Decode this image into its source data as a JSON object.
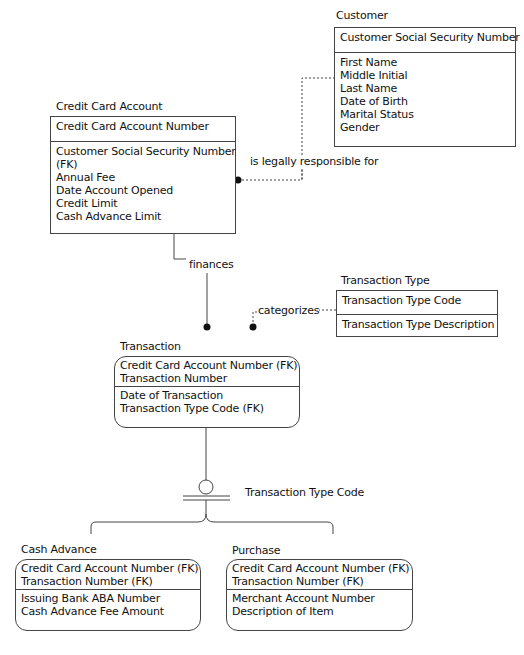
{
  "diagram": {
    "type": "IDEF1X entity-relationship diagram",
    "entities": {
      "customer": {
        "title": "Customer",
        "keys": [
          "Customer Social Security Number"
        ],
        "attributes": [
          "First Name",
          "Middle Initial",
          "Last Name",
          "Date of Birth",
          "Marital Status",
          "Gender"
        ]
      },
      "credit_card_account": {
        "title": "Credit Card Account",
        "keys": [
          "Credit Card Account Number"
        ],
        "attributes": [
          "Customer Social Security Number",
          "(FK)",
          "Annual Fee",
          "Date Account Opened",
          "Credit Limit",
          "Cash Advance Limit"
        ]
      },
      "transaction_type": {
        "title": "Transaction Type",
        "keys": [
          "Transaction Type Code"
        ],
        "attributes": [
          "Transaction Type Description"
        ]
      },
      "transaction": {
        "title": "Transaction",
        "keys": [
          "Credit Card Account Number (FK)",
          "Transaction Number"
        ],
        "attributes": [
          "Date of Transaction",
          "Transaction Type Code (FK)"
        ]
      },
      "cash_advance": {
        "title": "Cash Advance",
        "keys": [
          "Credit Card Account Number (FK)",
          "Transaction Number (FK)"
        ],
        "attributes": [
          "Issuing Bank ABA Number",
          "Cash Advance Fee Amount"
        ]
      },
      "purchase": {
        "title": "Purchase",
        "keys": [
          "Credit Card Account Number (FK)",
          "Transaction Number (FK)"
        ],
        "attributes": [
          "Merchant Account Number",
          "Description of Item"
        ]
      }
    },
    "relationships": {
      "responsible": {
        "label": "is legally responsible for",
        "from": "Customer",
        "to": "Credit Card Account",
        "style": "dotted"
      },
      "finances": {
        "label": "finances",
        "from": "Credit Card Account",
        "to": "Transaction",
        "style": "solid"
      },
      "categorizes": {
        "label": "categorizes",
        "from": "Transaction Type",
        "to": "Transaction",
        "style": "dotted"
      },
      "subtype": {
        "label": "Transaction Type Code",
        "parent": "Transaction",
        "children": [
          "Cash Advance",
          "Purchase"
        ],
        "style": "complete category"
      }
    },
    "colors": {
      "line": "#444444",
      "text": "#111111",
      "background": "#ffffff"
    }
  }
}
